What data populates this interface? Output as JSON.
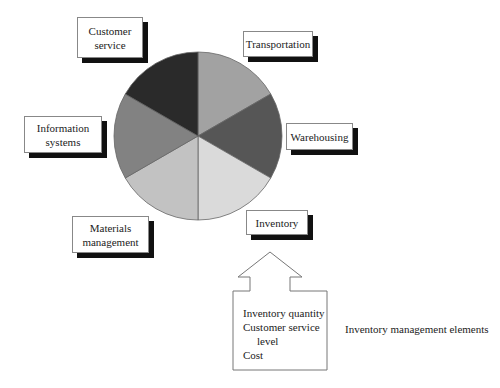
{
  "diagram": {
    "title": "Inventory management elements",
    "pie": {
      "center": [
        198,
        136
      ],
      "radius": 84,
      "slices": [
        {
          "name": "Transportation",
          "color": "#a2a2a2"
        },
        {
          "name": "Warehousing",
          "color": "#565656"
        },
        {
          "name": "Inventory",
          "color": "#dadada"
        },
        {
          "name": "Materials management",
          "color": "#c2c2c2"
        },
        {
          "name": "Information systems",
          "color": "#828282"
        },
        {
          "name": "Customer service",
          "color": "#2a2a2a"
        }
      ]
    },
    "labels": {
      "customer_service": {
        "line1": "Customer",
        "line2": "service"
      },
      "transportation": {
        "line1": "Transportation"
      },
      "warehousing": {
        "line1": "Warehousing"
      },
      "information_systems": {
        "line1": "Information",
        "line2": "systems"
      },
      "materials_management": {
        "line1": "Materials",
        "line2": "management"
      },
      "inventory": {
        "line1": "Inventory"
      }
    },
    "elements_box": {
      "items": [
        "Inventory quantity",
        "Customer service",
        "level",
        "Cost"
      ]
    },
    "caption": "Inventory management elements"
  }
}
